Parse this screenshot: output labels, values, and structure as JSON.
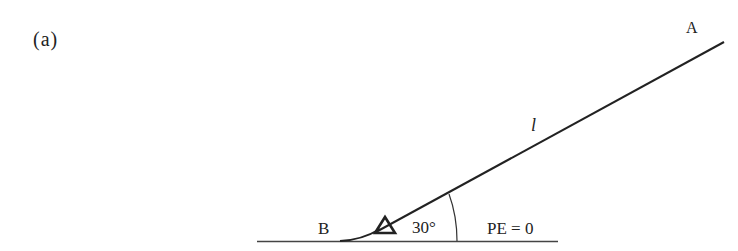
{
  "figure": {
    "panel_label": "(a)",
    "point_a": "A",
    "point_b": "B",
    "length_label": "l",
    "angle_label": "30°",
    "pe_label": "PE = 0"
  },
  "colors": {
    "ink": "#222222",
    "background": "#ffffff"
  }
}
